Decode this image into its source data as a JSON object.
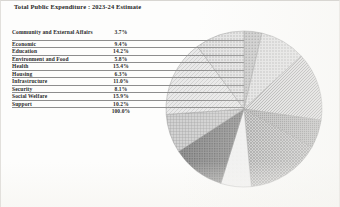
{
  "document": {
    "title": "Total Public Expenditure : 2023-24 Estimate"
  },
  "table": {
    "total_label": "",
    "total_value": "100.0%",
    "rows": [
      {
        "category": "Community and External Affairs",
        "percent": "3.7%"
      },
      {
        "category": "Economic",
        "percent": "9.4%"
      },
      {
        "category": "Education",
        "percent": "14.2%"
      },
      {
        "category": "Environment and Food",
        "percent": "5.8%"
      },
      {
        "category": "Health",
        "percent": "15.4%"
      },
      {
        "category": "Housing",
        "percent": "6.3%"
      },
      {
        "category": "Infrastructure",
        "percent": "11.0%"
      },
      {
        "category": "Security",
        "percent": "8.1%"
      },
      {
        "category": "Social Welfare",
        "percent": "15.9%"
      },
      {
        "category": "Support",
        "percent": "10.2%"
      }
    ]
  },
  "chart_data": {
    "type": "pie",
    "title": "Total Public Expenditure : 2023-24 Estimate",
    "xlabel": "",
    "ylabel": "",
    "legend_position": "none",
    "start_angle_deg": 0,
    "direction": "clockwise",
    "total": "100.0%",
    "categories": [
      "Community and External Affairs",
      "Economic",
      "Education",
      "Environment and Food",
      "Health",
      "Housing",
      "Infrastructure",
      "Security",
      "Social Welfare",
      "Support"
    ],
    "values": [
      3.7,
      9.4,
      14.2,
      5.8,
      15.4,
      6.3,
      11.0,
      8.1,
      15.9,
      10.2
    ],
    "labels": [
      "3.7%",
      "9.4%",
      "14.2%",
      "5.8%",
      "15.4%",
      "6.3%",
      "11.0%",
      "8.1%",
      "15.9%",
      "10.2%"
    ],
    "slice_fills": [
      "#b9b9b9",
      "#d4d4d4",
      "#c9c9c9",
      "#8f8f8f",
      "#9e9e9e",
      "#efefef",
      "#6f6f6f",
      "#a8a8a8",
      "#dedede",
      "#bdbdbd"
    ],
    "slice_patterns": [
      "solid",
      "dots",
      "hatch",
      "dense-dots",
      "crosshatch",
      "plain",
      "dark-dots",
      "grid",
      "light-hatch",
      "dots"
    ]
  }
}
